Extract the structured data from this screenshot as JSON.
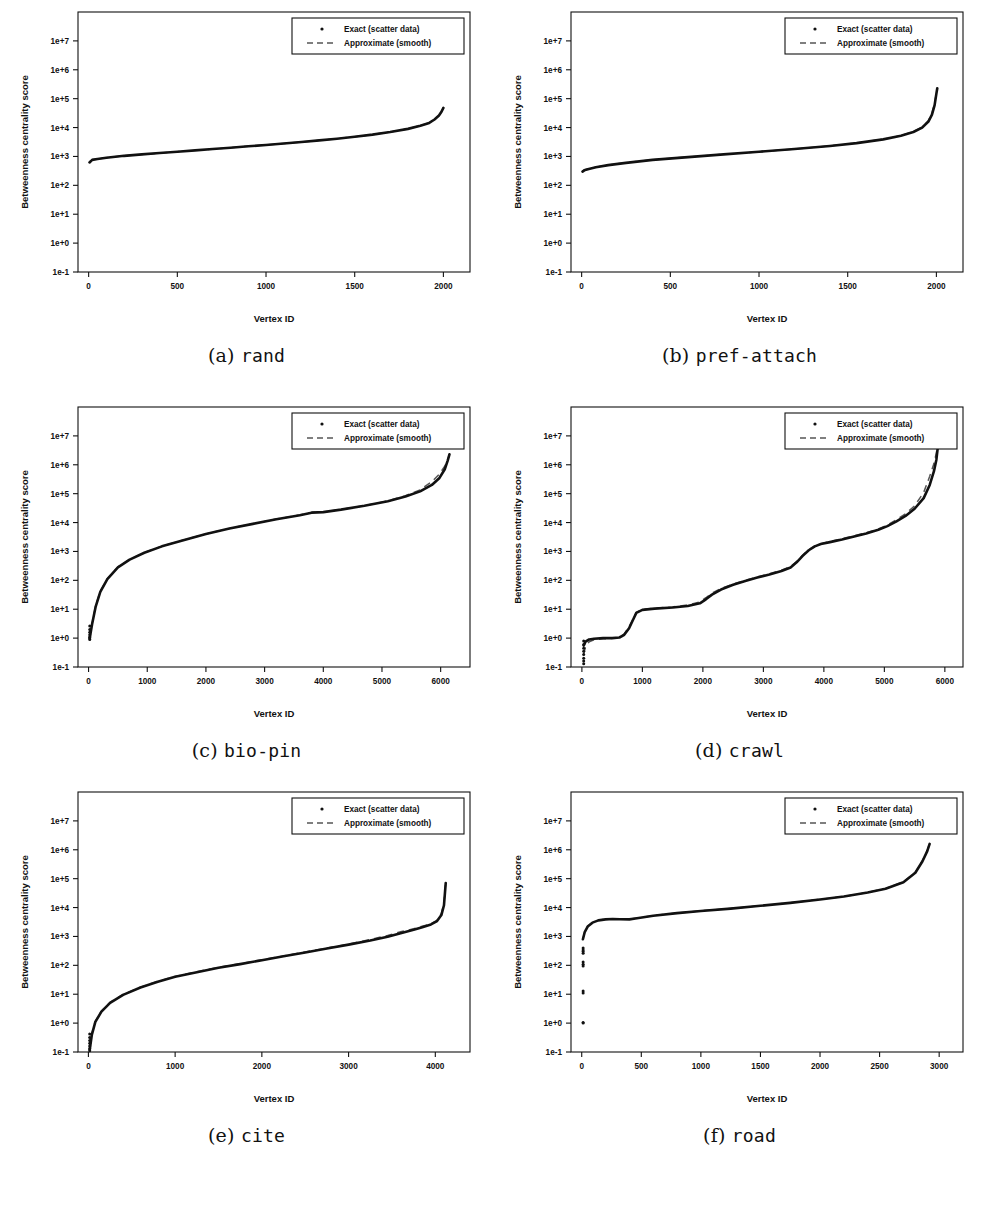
{
  "figure": {
    "axis_labels": {
      "x": "Vertex ID",
      "y": "Betweenness centrality score"
    },
    "legend": {
      "exact": "Exact (scatter data)",
      "approximate": "Approximate (smooth)"
    },
    "y_ticks": [
      "1e+7",
      "1e+6",
      "1e+5",
      "1e+4",
      "1e+3",
      "1e+2",
      "1e+1",
      "1e+0",
      "1e-1"
    ],
    "colors": {
      "exact": "#111111",
      "approximate": "#555555",
      "frame": "#111111",
      "background": "#ffffff"
    },
    "captions": [
      {
        "tag": "(a)",
        "name": "rand"
      },
      {
        "tag": "(b)",
        "name": "pref-attach"
      },
      {
        "tag": "(c)",
        "name": "bio-pin"
      },
      {
        "tag": "(d)",
        "name": "crawl"
      },
      {
        "tag": "(e)",
        "name": "cite"
      },
      {
        "tag": "(f)",
        "name": "road"
      }
    ]
  },
  "chart_data": [
    {
      "id": "rand",
      "type": "line",
      "title": "rand",
      "xlabel": "Vertex ID",
      "ylabel": "Betweenness centrality score",
      "yscale": "log",
      "ylim": [
        0.1,
        100000000
      ],
      "xlim": [
        -60,
        2150
      ],
      "xticks": [
        0,
        500,
        1000,
        1500,
        2000
      ],
      "yticks": [
        0.1,
        1,
        10,
        100,
        1000,
        10000,
        100000,
        1000000,
        10000000
      ],
      "grid": false,
      "legend_position": "top-right",
      "series": [
        {
          "name": "Exact (scatter data)",
          "style": "scatter",
          "x": [
            5,
            20,
            50,
            100,
            200,
            300,
            400,
            500,
            600,
            700,
            800,
            900,
            1000,
            1100,
            1200,
            1300,
            1400,
            1500,
            1600,
            1700,
            1800,
            1870,
            1920,
            1950,
            1975,
            1990,
            2000
          ],
          "y": [
            620,
            760,
            820,
            900,
            1050,
            1180,
            1320,
            1460,
            1620,
            1800,
            2000,
            2250,
            2500,
            2800,
            3150,
            3600,
            4100,
            4800,
            5700,
            7000,
            9000,
            11500,
            14500,
            19000,
            26000,
            36000,
            48000
          ]
        },
        {
          "name": "Approximate (smooth)",
          "style": "dashed",
          "x": [
            5,
            20,
            50,
            100,
            200,
            300,
            400,
            500,
            600,
            700,
            800,
            900,
            1000,
            1100,
            1200,
            1300,
            1400,
            1500,
            1600,
            1700,
            1800,
            1870,
            1920,
            1950,
            1975,
            1990,
            2000
          ],
          "y": [
            640,
            770,
            830,
            905,
            1045,
            1175,
            1310,
            1455,
            1615,
            1795,
            2010,
            2260,
            2510,
            2810,
            3160,
            3610,
            4120,
            4820,
            5720,
            7050,
            9050,
            11600,
            14600,
            19200,
            26200,
            36200,
            48200
          ]
        }
      ],
      "left_scatter": []
    },
    {
      "id": "pref-attach",
      "type": "line",
      "title": "pref-attach",
      "xlabel": "Vertex ID",
      "ylabel": "Betweenness centrality score",
      "yscale": "log",
      "ylim": [
        0.1,
        100000000
      ],
      "xlim": [
        -60,
        2150
      ],
      "xticks": [
        0,
        500,
        1000,
        1500,
        2000
      ],
      "yticks": [
        0.1,
        1,
        10,
        100,
        1000,
        10000,
        100000,
        1000000,
        10000000
      ],
      "grid": false,
      "legend_position": "top-right",
      "series": [
        {
          "name": "Exact (scatter data)",
          "style": "scatter",
          "x": [
            5,
            15,
            40,
            80,
            150,
            250,
            400,
            600,
            800,
            1000,
            1200,
            1400,
            1550,
            1700,
            1800,
            1870,
            1920,
            1955,
            1975,
            1990,
            2000,
            2005
          ],
          "y": [
            300,
            330,
            370,
            420,
            500,
            600,
            760,
            950,
            1180,
            1450,
            1800,
            2300,
            2900,
            3900,
            5200,
            7000,
            10000,
            16000,
            28000,
            60000,
            150000,
            230000
          ]
        },
        {
          "name": "Approximate (smooth)",
          "style": "dashed",
          "x": [
            5,
            15,
            40,
            80,
            150,
            250,
            400,
            600,
            800,
            1000,
            1200,
            1400,
            1550,
            1700,
            1800,
            1870,
            1920,
            1955,
            1975,
            1990,
            2000,
            2005
          ],
          "y": [
            310,
            340,
            375,
            425,
            505,
            605,
            765,
            955,
            1190,
            1460,
            1810,
            2320,
            2920,
            3950,
            5280,
            7200,
            10500,
            17500,
            32000,
            70000,
            160000,
            235000
          ]
        }
      ],
      "left_scatter": []
    },
    {
      "id": "bio-pin",
      "type": "line",
      "title": "bio-pin",
      "xlabel": "Vertex ID",
      "ylabel": "Betweenness centrality score",
      "yscale": "log",
      "ylim": [
        0.1,
        100000000
      ],
      "xlim": [
        -180,
        6500
      ],
      "xticks": [
        0,
        1000,
        2000,
        3000,
        4000,
        5000,
        6000
      ],
      "yticks": [
        0.1,
        1,
        10,
        100,
        1000,
        10000,
        100000,
        1000000,
        10000000
      ],
      "grid": false,
      "legend_position": "top-right",
      "series": [
        {
          "name": "Exact (scatter data)",
          "style": "scatter",
          "x": [
            20,
            60,
            120,
            200,
            320,
            500,
            700,
            950,
            1250,
            1600,
            2000,
            2400,
            2800,
            3200,
            3600,
            3800,
            4000,
            4300,
            4700,
            5100,
            5400,
            5650,
            5850,
            5980,
            6070,
            6120,
            6150
          ],
          "y": [
            1.0,
            3.0,
            12,
            40,
            110,
            280,
            520,
            900,
            1500,
            2400,
            4000,
            6200,
            9000,
            13000,
            18000,
            22000,
            23000,
            28000,
            38000,
            55000,
            80000,
            120000,
            200000,
            350000,
            700000,
            1400000,
            2300000
          ]
        },
        {
          "name": "Approximate (smooth)",
          "style": "dashed",
          "x": [
            20,
            60,
            120,
            200,
            320,
            500,
            700,
            950,
            1250,
            1600,
            2000,
            2400,
            2800,
            3200,
            3600,
            3800,
            4000,
            4300,
            4700,
            5100,
            5400,
            5650,
            5850,
            5980,
            6070,
            6120,
            6150
          ],
          "y": [
            1.1,
            3.2,
            13,
            42,
            115,
            290,
            530,
            920,
            1520,
            2430,
            4050,
            6250,
            9100,
            13200,
            18300,
            22300,
            23400,
            28500,
            38500,
            56000,
            85000,
            135000,
            260000,
            480000,
            900000,
            1500000,
            2350000
          ]
        }
      ],
      "left_scatter": {
        "x": 20,
        "y": [
          0.9,
          1.0,
          1.1,
          1.3,
          1.6,
          2.0,
          2.6
        ]
      }
    },
    {
      "id": "crawl",
      "type": "line",
      "title": "crawl",
      "xlabel": "Vertex ID",
      "ylabel": "Betweenness centrality score",
      "yscale": "log",
      "ylim": [
        0.1,
        100000000
      ],
      "xlim": [
        -180,
        6300
      ],
      "xticks": [
        0,
        1000,
        2000,
        3000,
        4000,
        5000,
        6000
      ],
      "yticks": [
        0.1,
        1,
        10,
        100,
        1000,
        10000,
        100000,
        1000000,
        10000000
      ],
      "grid": false,
      "legend_position": "top-right",
      "series": [
        {
          "name": "Exact (scatter data)",
          "style": "scatter",
          "x": [
            30,
            60,
            120,
            200,
            350,
            500,
            620,
            700,
            780,
            850,
            900,
            1000,
            1200,
            1500,
            1750,
            1950,
            2050,
            2150,
            2300,
            2500,
            2700,
            2900,
            3100,
            3300,
            3450,
            3550,
            3650,
            3750,
            3850,
            3950,
            4100,
            4300,
            4500,
            4700,
            4900,
            5050,
            5200,
            5350,
            5500,
            5650,
            5750,
            5820,
            5860,
            5880,
            5890
          ],
          "y": [
            0.55,
            0.75,
            0.9,
            0.95,
            1.0,
            1.0,
            1.05,
            1.3,
            2.2,
            4.5,
            7.5,
            9.5,
            10.5,
            11.5,
            13,
            16,
            22,
            32,
            48,
            70,
            95,
            125,
            160,
            210,
            280,
            420,
            700,
            1100,
            1500,
            1800,
            2100,
            2600,
            3300,
            4200,
            5600,
            7500,
            11000,
            17000,
            30000,
            70000,
            200000,
            600000,
            1500000,
            3500000,
            6000000
          ]
        },
        {
          "name": "Approximate (smooth)",
          "style": "dashed",
          "x": [
            30,
            60,
            120,
            200,
            350,
            500,
            620,
            700,
            780,
            850,
            900,
            1000,
            1200,
            1500,
            1750,
            1950,
            2050,
            2150,
            2300,
            2500,
            2700,
            2900,
            3100,
            3300,
            3450,
            3550,
            3650,
            3750,
            3850,
            3950,
            4100,
            4300,
            4500,
            4700,
            4900,
            5050,
            5200,
            5350,
            5500,
            5650,
            5750,
            5820,
            5860,
            5880,
            5890
          ],
          "y": [
            0.28,
            0.5,
            0.75,
            0.88,
            0.95,
            0.98,
            1.05,
            1.4,
            2.5,
            4.8,
            7.8,
            9.8,
            10.8,
            12,
            14,
            18,
            25,
            36,
            52,
            74,
            100,
            130,
            170,
            225,
            300,
            450,
            750,
            1150,
            1550,
            1850,
            2200,
            2750,
            3500,
            4500,
            6000,
            8200,
            12500,
            20000,
            38000,
            110000,
            400000,
            1100000,
            2600000,
            4500000,
            6200000
          ]
        }
      ],
      "left_scatter": {
        "x": 30,
        "y": [
          0.13,
          0.16,
          0.2,
          0.27,
          0.35,
          0.45,
          0.6,
          0.8
        ]
      }
    },
    {
      "id": "cite",
      "type": "line",
      "title": "cite",
      "xlabel": "Vertex ID",
      "ylabel": "Betweenness centrality score",
      "yscale": "log",
      "ylim": [
        0.1,
        100000000
      ],
      "xlim": [
        -120,
        4400
      ],
      "xticks": [
        0,
        1000,
        2000,
        3000,
        4000
      ],
      "yticks": [
        0.1,
        1,
        10,
        100,
        1000,
        10000,
        100000,
        1000000,
        10000000
      ],
      "grid": false,
      "legend_position": "top-right",
      "series": [
        {
          "name": "Exact (scatter data)",
          "style": "scatter",
          "x": [
            15,
            40,
            80,
            150,
            250,
            400,
            600,
            800,
            1000,
            1250,
            1500,
            1750,
            2000,
            2250,
            2500,
            2750,
            3000,
            3250,
            3450,
            3600,
            3750,
            3850,
            3950,
            4020,
            4070,
            4100,
            4120
          ],
          "y": [
            0.12,
            0.4,
            1.1,
            2.5,
            5.0,
            9.5,
            17,
            27,
            40,
            58,
            82,
            110,
            150,
            205,
            280,
            380,
            520,
            720,
            980,
            1300,
            1700,
            2100,
            2600,
            3400,
            5500,
            12000,
            70000
          ]
        },
        {
          "name": "Approximate (smooth)",
          "style": "dashed",
          "x": [
            15,
            40,
            80,
            150,
            250,
            400,
            600,
            800,
            1000,
            1250,
            1500,
            1750,
            2000,
            2250,
            2500,
            2750,
            3000,
            3250,
            3450,
            3600,
            3750,
            3850,
            3950,
            4020,
            4070,
            4100,
            4120
          ],
          "y": [
            0.14,
            0.45,
            1.15,
            2.6,
            5.2,
            9.8,
            17.5,
            28,
            41,
            60,
            85,
            115,
            155,
            212,
            290,
            395,
            545,
            780,
            1080,
            1450,
            1850,
            2250,
            2750,
            3600,
            6200,
            15000,
            75000
          ]
        }
      ],
      "left_scatter": {
        "x": 15,
        "y": [
          0.11,
          0.13,
          0.16,
          0.2,
          0.25,
          0.32,
          0.42
        ]
      }
    },
    {
      "id": "road",
      "type": "line",
      "title": "road",
      "xlabel": "Vertex ID",
      "ylabel": "Betweenness centrality score",
      "yscale": "log",
      "ylim": [
        0.1,
        100000000
      ],
      "xlim": [
        -90,
        3200
      ],
      "xticks": [
        0,
        500,
        1000,
        1500,
        2000,
        2500,
        3000
      ],
      "yticks": [
        0.1,
        1,
        10,
        100,
        1000,
        10000,
        100000,
        1000000,
        10000000
      ],
      "grid": false,
      "legend_position": "top-right",
      "series": [
        {
          "name": "Exact (scatter data)",
          "style": "scatter",
          "x": [
            10,
            25,
            50,
            90,
            140,
            200,
            260,
            320,
            400,
            450,
            600,
            800,
            1000,
            1250,
            1500,
            1750,
            2000,
            2200,
            2400,
            2550,
            2700,
            2800,
            2860,
            2900,
            2920
          ],
          "y": [
            800,
            1400,
            2200,
            3000,
            3600,
            3900,
            4000,
            3950,
            3900,
            4200,
            5200,
            6400,
            7600,
            9200,
            11500,
            14500,
            19000,
            24000,
            33000,
            45000,
            75000,
            160000,
            400000,
            900000,
            1600000
          ]
        },
        {
          "name": "Approximate (smooth)",
          "style": "dashed",
          "x": [
            10,
            25,
            50,
            90,
            140,
            200,
            260,
            320,
            400,
            450,
            600,
            800,
            1000,
            1250,
            1500,
            1750,
            2000,
            2200,
            2400,
            2550,
            2700,
            2800,
            2860,
            2900,
            2920
          ],
          "y": [
            820,
            1450,
            2250,
            3050,
            3650,
            3950,
            4050,
            4000,
            3950,
            4250,
            5250,
            6450,
            7700,
            9300,
            11600,
            14700,
            19200,
            24300,
            33500,
            46000,
            78000,
            165000,
            420000,
            950000,
            1650000
          ]
        }
      ],
      "left_scatter": {
        "x": 12,
        "y": [
          1.0,
          1.05,
          11,
          13,
          95,
          110,
          130,
          260,
          300,
          340,
          400
        ]
      }
    }
  ]
}
